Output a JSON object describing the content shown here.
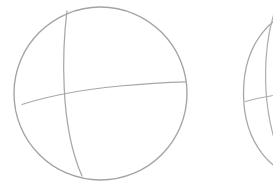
{
  "canvas": {
    "width": 273,
    "height": 181,
    "background_color": "#ffffff",
    "title": "Sphere sketch"
  },
  "style": {
    "stroke_color": "#a3a3a3",
    "stroke_color_light": "#b8b8b8",
    "stroke_width": 1.3,
    "stroke_width_thin": 1.1
  },
  "chart_data": {
    "type": "line",
    "xlabel": "",
    "ylabel": "",
    "xlim": [
      0,
      273
    ],
    "ylim": [
      0,
      181
    ],
    "grid": false,
    "legend": "none",
    "series": [
      {
        "name": "sphere-1-outline",
        "shape": "circle",
        "center": [
          100.5,
          93.5
        ],
        "radius": 86.5,
        "path": "M 100.5 7 C 148 7 187 45.7 187 93.5 C 187 141.3 148 180 100.5 180 C 53 180 14 141.3 14 93.5 C 14 45.7 53 7 100.5 7 Z"
      },
      {
        "name": "sphere-1-meridian",
        "shape": "open-curve",
        "start": [
          67,
          11
        ],
        "end": [
          82,
          176
        ],
        "path": "M 67 11 C 63.5 38 63 62 64.2 88 C 65.6 118 70.5 150 82 176"
      },
      {
        "name": "sphere-1-equator",
        "shape": "open-curve",
        "start": [
          22,
          104
        ],
        "end": [
          186,
          82
        ],
        "path": "M 22 104.5 C 48 96 84 89.5 120 86 C 145 83.6 168 82.3 186 81.8"
      },
      {
        "name": "sphere-2-outline",
        "shape": "circle-clipped",
        "center": [
          330,
          93
        ],
        "radius": 86.5,
        "path": "M 318 6.8 C 270.5 6.8 243.5 45.5 243.5 93.3 C 243.5 141 270.5 180 318 180"
      },
      {
        "name": "sphere-2-meridian",
        "shape": "open-curve",
        "start": [
          275,
          10
        ],
        "end": [
          290,
          178
        ],
        "path": "M 275 10 C 266 38 264.5 63 266 90 C 267.5 119 275.5 152 290 178"
      },
      {
        "name": "sphere-2-equator",
        "shape": "open-curve",
        "start": [
          245,
          101
        ],
        "end": [
          290,
          93
        ],
        "path": "M 245.5 101.5 C 258 98 272 95 290 93.4"
      }
    ]
  }
}
